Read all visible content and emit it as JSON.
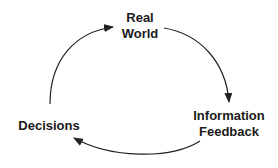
{
  "diagram": {
    "type": "cycle",
    "nodes": [
      {
        "id": "real-world",
        "lines": [
          "Real",
          "World"
        ]
      },
      {
        "id": "information-feedback",
        "lines": [
          "Information",
          "Feedback"
        ]
      },
      {
        "id": "decisions",
        "lines": [
          "Decisions"
        ]
      }
    ],
    "edges": [
      {
        "from": "decisions",
        "to": "real-world"
      },
      {
        "from": "real-world",
        "to": "information-feedback"
      },
      {
        "from": "information-feedback",
        "to": "decisions"
      }
    ],
    "colors": {
      "text": "#1a1a1a",
      "arrow": "#222222",
      "background": "#ffffff"
    }
  }
}
